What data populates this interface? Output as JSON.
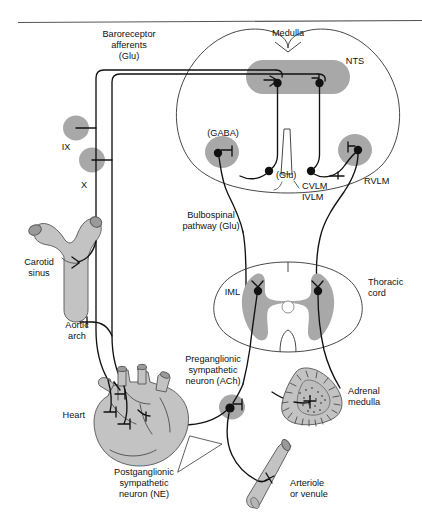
{
  "figure": {
    "width": 422,
    "height": 525,
    "background": "#ffffff",
    "line_color": "#111111",
    "shade_color": "#a8a8a8",
    "organ_color": "#c3c3c3"
  },
  "labels": {
    "baroreceptor_afferents": "Baroreceptor",
    "baroreceptor_afferents_2": "afferents",
    "baroreceptor_afferents_3": "(Glu)",
    "medulla": "Medulla",
    "nts": "NTS",
    "gaba": "(GABA)",
    "glu": "(Glu)",
    "cvlm": "CVLM",
    "ivlm": "IVLM",
    "rvlm": "RVLM",
    "nerve_ix": "IX",
    "nerve_x": "X",
    "carotid_sinus": "Carotid",
    "carotid_sinus_2": "sinus",
    "aortic_arch": "Aortic",
    "aortic_arch_2": "arch",
    "bulbospinal": "Bulbospinal",
    "bulbospinal_2": "pathway (Glu)",
    "iml": "IML",
    "thoracic_cord": "Thoracic",
    "thoracic_cord_2": "cord",
    "preganglionic": "Preganglionic",
    "preganglionic_2": "sympathetic",
    "preganglionic_3": "neuron (ACh)",
    "heart": "Heart",
    "adrenal_medulla": "Adrenal",
    "adrenal_medulla_2": "medulla",
    "postganglionic": "Postganglionic",
    "postganglionic_2": "sympathetic",
    "postganglionic_3": "neuron (NE)",
    "arteriole": "Arteriole",
    "arteriole_2": "or venule"
  }
}
